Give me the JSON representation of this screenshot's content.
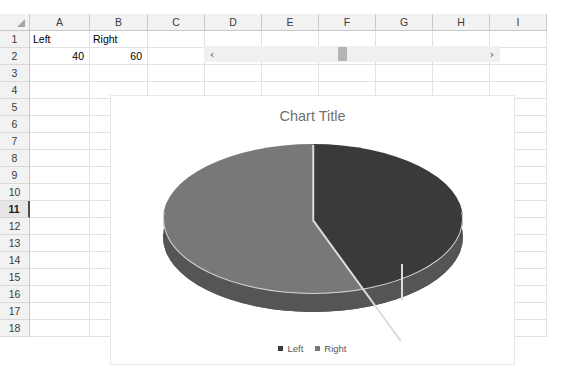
{
  "spreadsheet": {
    "columns": [
      "A",
      "B",
      "C",
      "D",
      "E",
      "F",
      "G",
      "H",
      "I"
    ],
    "rows": [
      "1",
      "2",
      "3",
      "4",
      "5",
      "6",
      "7",
      "8",
      "9",
      "10",
      "11",
      "12",
      "13",
      "14",
      "15",
      "16",
      "17",
      "18"
    ],
    "active_row": "11",
    "cells": {
      "A1": "Left",
      "B1": "Right",
      "A2": "40",
      "B2": "60"
    },
    "corner_select_all": "select-all-corner"
  },
  "scrollbar": {
    "left_arrow": "‹",
    "right_arrow": "›",
    "orientation": "horizontal"
  },
  "chart": {
    "title": "Chart Title",
    "legend": [
      {
        "label": "Left",
        "color": "#3a3a3a"
      },
      {
        "label": "Right",
        "color": "#787878"
      }
    ]
  },
  "chart_data": {
    "type": "pie",
    "title": "Chart Title",
    "subtitle": "",
    "categories": [
      "Left",
      "Right"
    ],
    "values": [
      40,
      60
    ],
    "percentages": [
      40,
      60
    ],
    "colors": [
      "#3a3a3a",
      "#787878"
    ],
    "three_d": true,
    "start_angle_deg": 0,
    "direction": "clockwise",
    "legend_position": "bottom",
    "data_labels": false,
    "grid": false,
    "xlabel": "",
    "ylabel": ""
  },
  "theme": {
    "header_bg": "#f2f2f2",
    "grid_line": "#e2e2e2",
    "header_line": "#c8c8c8",
    "title_color": "#707070",
    "slice_dark": "#3a3a3a",
    "slice_light": "#787878",
    "wall_color": "#4a4a4a",
    "scroll_thumb": "#b4b4b4"
  }
}
